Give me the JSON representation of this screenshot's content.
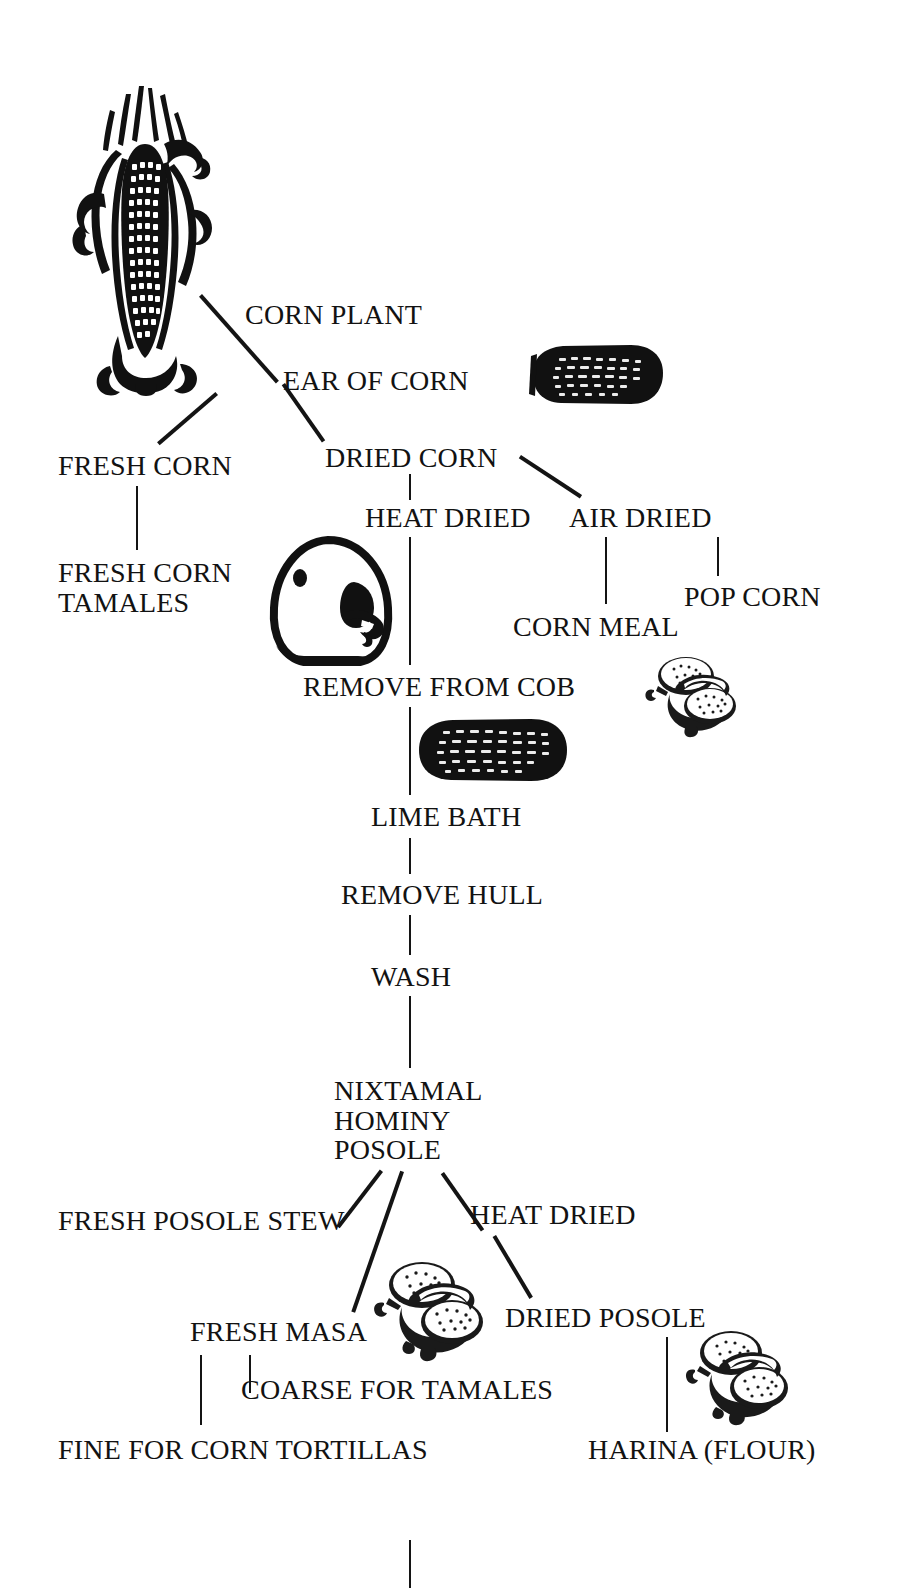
{
  "diagram": {
    "ink_color": "#141414",
    "background_color": "#ffffff",
    "nodes": [
      {
        "id": "corn-plant",
        "label": "CORN PLANT",
        "x": 245,
        "y": 300,
        "align": "left"
      },
      {
        "id": "ear-of-corn",
        "label": "EAR OF CORN",
        "x": 283,
        "y": 366,
        "align": "left"
      },
      {
        "id": "dried-corn",
        "label": "DRIED CORN",
        "x": 325,
        "y": 443,
        "align": "left"
      },
      {
        "id": "fresh-corn",
        "label": "FRESH CORN",
        "x": 58,
        "y": 451,
        "align": "left"
      },
      {
        "id": "heat-dried-1",
        "label": "HEAT DRIED",
        "x": 365,
        "y": 503,
        "align": "left"
      },
      {
        "id": "air-dried",
        "label": "AIR DRIED",
        "x": 569,
        "y": 503,
        "align": "left"
      },
      {
        "id": "fresh-corn-tamales",
        "label": "FRESH CORN\nTAMALES",
        "x": 58,
        "y": 558,
        "align": "left"
      },
      {
        "id": "pop-corn",
        "label": "POP CORN",
        "x": 684,
        "y": 582,
        "align": "left"
      },
      {
        "id": "corn-meal",
        "label": "CORN MEAL",
        "x": 513,
        "y": 612,
        "align": "left"
      },
      {
        "id": "remove-from-cob",
        "label": "REMOVE FROM COB",
        "x": 303,
        "y": 672,
        "align": "left"
      },
      {
        "id": "lime-bath",
        "label": "LIME BATH",
        "x": 371,
        "y": 802,
        "align": "left"
      },
      {
        "id": "remove-hull",
        "label": "REMOVE HULL",
        "x": 341,
        "y": 880,
        "align": "left"
      },
      {
        "id": "wash",
        "label": "WASH",
        "x": 371,
        "y": 962,
        "align": "left"
      },
      {
        "id": "nixtamal-hominy-posole",
        "label": "NIXTAMAL\nHOMINY\nPOSOLE",
        "x": 334,
        "y": 1076,
        "align": "left"
      },
      {
        "id": "fresh-posole-stew",
        "label": "FRESH POSOLE STEW",
        "x": 58,
        "y": 1206,
        "align": "left"
      },
      {
        "id": "heat-dried-2",
        "label": "HEAT DRIED",
        "x": 470,
        "y": 1200,
        "align": "left"
      },
      {
        "id": "fresh-masa",
        "label": "FRESH MASA",
        "x": 190,
        "y": 1317,
        "align": "left"
      },
      {
        "id": "dried-posole",
        "label": "DRIED POSOLE",
        "x": 505,
        "y": 1303,
        "align": "left"
      },
      {
        "id": "coarse-for-tamales",
        "label": "COARSE FOR TAMALES",
        "x": 241,
        "y": 1375,
        "align": "left"
      },
      {
        "id": "fine-for-corn-tortillas",
        "label": "FINE FOR CORN TORTILLAS",
        "x": 58,
        "y": 1435,
        "align": "left"
      },
      {
        "id": "harina-flour",
        "label": "HARINA (FLOUR)",
        "x": 588,
        "y": 1435,
        "align": "left"
      }
    ],
    "connectors": [
      {
        "id": "corn-plant-to-ear",
        "kind": "diagonal",
        "from": [
          202,
          294
        ],
        "to": [
          279,
          381
        ]
      },
      {
        "id": "ear-to-fresh-corn",
        "kind": "diagonal",
        "from": [
          218,
          395
        ],
        "to": [
          160,
          445
        ]
      },
      {
        "id": "ear-to-dried-corn",
        "kind": "diagonal",
        "from": [
          285,
          383
        ],
        "to": [
          325,
          440
        ]
      },
      {
        "id": "dried-corn-to-air-dried",
        "kind": "diagonal",
        "from": [
          521,
          455
        ],
        "to": [
          582,
          495
        ]
      },
      {
        "id": "dried-corn-to-heat-dried",
        "kind": "vertical",
        "x": 409,
        "y1": 474,
        "y2": 500
      },
      {
        "id": "fresh-corn-to-tamales",
        "kind": "vertical",
        "x": 136,
        "y1": 486,
        "y2": 550
      },
      {
        "id": "air-dried-to-corn-meal",
        "kind": "vertical",
        "x": 605,
        "y1": 537,
        "y2": 604
      },
      {
        "id": "air-dried-to-pop-corn",
        "kind": "vertical",
        "x": 717,
        "y1": 537,
        "y2": 576
      },
      {
        "id": "heat-dried-to-remove-cob",
        "kind": "vertical",
        "x": 409,
        "y1": 537,
        "y2": 665
      },
      {
        "id": "remove-cob-to-lime-bath",
        "kind": "vertical",
        "x": 409,
        "y1": 707,
        "y2": 795
      },
      {
        "id": "lime-bath-to-remove-hull",
        "kind": "vertical",
        "x": 409,
        "y1": 838,
        "y2": 874
      },
      {
        "id": "remove-hull-to-wash",
        "kind": "vertical",
        "x": 409,
        "y1": 915,
        "y2": 955
      },
      {
        "id": "wash-to-nixtamal",
        "kind": "vertical",
        "x": 409,
        "y1": 996,
        "y2": 1068
      },
      {
        "id": "posole-to-fresh-stew",
        "kind": "diagonal",
        "from": [
          383,
          1172
        ],
        "to": [
          340,
          1228
        ]
      },
      {
        "id": "posole-to-fresh-masa",
        "kind": "diagonal",
        "from": [
          404,
          1172
        ],
        "to": [
          355,
          1313
        ]
      },
      {
        "id": "posole-to-heat-dried",
        "kind": "diagonal",
        "from": [
          444,
          1172
        ],
        "to": [
          484,
          1229
        ]
      },
      {
        "id": "heat-dried-to-dried-posole",
        "kind": "diagonal",
        "from": [
          496,
          1235
        ],
        "to": [
          533,
          1297
        ]
      },
      {
        "id": "fresh-masa-to-fine-tortillas",
        "kind": "vertical",
        "x": 200,
        "y1": 1355,
        "y2": 1425
      },
      {
        "id": "fresh-masa-to-coarse-tamales",
        "kind": "vertical",
        "x": 249,
        "y1": 1355,
        "y2": 1393
      },
      {
        "id": "dried-posole-to-harina",
        "kind": "vertical",
        "x": 666,
        "y1": 1337,
        "y2": 1432
      },
      {
        "id": "bottom-stub",
        "kind": "vertical",
        "x": 409,
        "y1": 1540,
        "y2": 1588
      }
    ],
    "illustrations": [
      {
        "id": "corn-plant-illustration",
        "name": "corn-plant-with-husk-illustration",
        "x": 44,
        "y": 78,
        "w": 190,
        "h": 320
      },
      {
        "id": "dried-ear-1",
        "name": "dried-corn-ear-illustration",
        "x": 515,
        "y": 340,
        "w": 152,
        "h": 70
      },
      {
        "id": "grinding-stone",
        "name": "metate-grinding-stone-illustration",
        "x": 268,
        "y": 534,
        "w": 126,
        "h": 136
      },
      {
        "id": "tortillas-1",
        "name": "tortillas-with-filling-illustration",
        "x": 640,
        "y": 650,
        "w": 108,
        "h": 88
      },
      {
        "id": "dried-ear-2",
        "name": "dried-corn-ear-illustration",
        "x": 413,
        "y": 714,
        "w": 158,
        "h": 72
      },
      {
        "id": "tortillas-2",
        "name": "tortillas-with-filling-illustration",
        "x": 368,
        "y": 1255,
        "w": 130,
        "h": 110
      },
      {
        "id": "tortillas-3",
        "name": "tortillas-with-filling-illustration",
        "x": 680,
        "y": 1325,
        "w": 122,
        "h": 104
      }
    ]
  }
}
